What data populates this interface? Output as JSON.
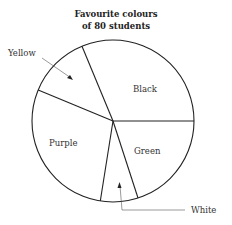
{
  "chart_data": {
    "type": "pie",
    "title": "Favourite colours of 80 students",
    "title_lines": [
      "Favourite colours",
      "of 80 students"
    ],
    "total": 80,
    "categories": [
      "Black",
      "Yellow",
      "Purple",
      "White",
      "Green"
    ],
    "values": [
      25,
      10,
      23,
      6,
      16
    ],
    "angles_deg": [
      112,
      45,
      105,
      27,
      71
    ],
    "labels": {
      "black": "Black",
      "yellow": "Yellow",
      "purple": "Purple",
      "white": "White",
      "green": "Green"
    },
    "legend": "none",
    "grid": false,
    "fill": "#ffffff",
    "stroke": "#222222"
  }
}
